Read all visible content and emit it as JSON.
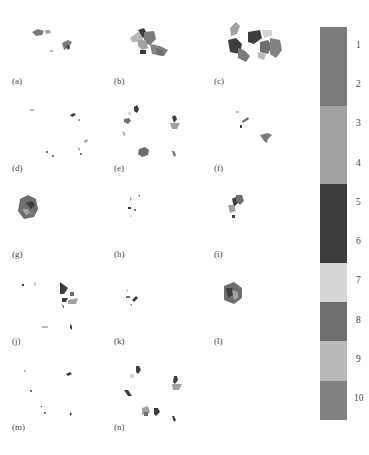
{
  "figure": {
    "panels": [
      {
        "id": "a",
        "label": "(a)",
        "x": 10,
        "y": 10
      },
      {
        "id": "b",
        "label": "(b)",
        "x": 112,
        "y": 10
      },
      {
        "id": "c",
        "label": "(c)",
        "x": 212,
        "y": 10
      },
      {
        "id": "d",
        "label": "(d)",
        "x": 10,
        "y": 97
      },
      {
        "id": "e",
        "label": "(e)",
        "x": 112,
        "y": 97
      },
      {
        "id": "f",
        "label": "(f)",
        "x": 212,
        "y": 97
      },
      {
        "id": "g",
        "label": "(g)",
        "x": 10,
        "y": 183
      },
      {
        "id": "h",
        "label": "(h)",
        "x": 112,
        "y": 183
      },
      {
        "id": "i",
        "label": "(i)",
        "x": 212,
        "y": 183
      },
      {
        "id": "j",
        "label": "(j)",
        "x": 10,
        "y": 270
      },
      {
        "id": "k",
        "label": "(k)",
        "x": 112,
        "y": 270
      },
      {
        "id": "l",
        "label": "(l)",
        "x": 212,
        "y": 270
      },
      {
        "id": "m",
        "label": "(m)",
        "x": 10,
        "y": 356
      },
      {
        "id": "n",
        "label": "(n)",
        "x": 112,
        "y": 356
      }
    ]
  },
  "colorbar": {
    "ticks": [
      "1",
      "2",
      "3",
      "4",
      "5",
      "6",
      "7",
      "8",
      "9",
      "10"
    ],
    "bands": [
      {
        "from": 1,
        "to": 2,
        "color": "#7b7b7b"
      },
      {
        "from": 3,
        "to": 4,
        "color": "#a2a2a2"
      },
      {
        "from": 5,
        "to": 6,
        "color": "#3d3d3d"
      },
      {
        "from": 7,
        "to": 7,
        "color": "#d6d6d6"
      },
      {
        "from": 8,
        "to": 8,
        "color": "#6e6e6e"
      },
      {
        "from": 9,
        "to": 9,
        "color": "#bababa"
      },
      {
        "from": 10,
        "to": 10,
        "color": "#828282"
      }
    ]
  }
}
